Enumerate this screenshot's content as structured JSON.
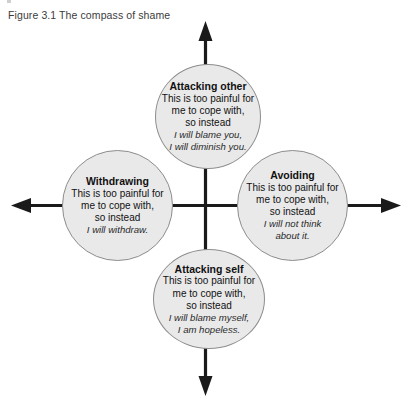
{
  "figure": {
    "caption": "Figure 3.1 The compass of shame",
    "background_color": "#ffffff",
    "circle_fill": "#e9e9e9",
    "circle_stroke": "#8d8d8d",
    "axis_color": "#1a1a1a"
  },
  "nodes": {
    "top": {
      "title": "Attacking other",
      "line1": "This is too painful for",
      "line2": "me to cope with,",
      "line3": "so instead",
      "italic1": "I will blame you,",
      "italic2": "I will diminish you."
    },
    "left": {
      "title": "Withdrawing",
      "line1": "This is too painful for",
      "line2": "me to cope with,",
      "line3": "so instead",
      "italic1": "I will withdraw.",
      "italic2": ""
    },
    "right": {
      "title": "Avoiding",
      "line1": "This is too painful for",
      "line2": "me to cope with,",
      "line3": "so instead",
      "italic1": "I will not think",
      "italic2": "about it."
    },
    "bottom": {
      "title": "Attacking self",
      "line1": "This is too painful for",
      "line2": "me to cope with,",
      "line3": "so instead",
      "italic1": "I will blame myself,",
      "italic2": "I am hopeless."
    }
  },
  "axes": {
    "up_arrow": "arrow-up",
    "down_arrow": "arrow-down",
    "left_arrow": "arrow-left",
    "right_arrow": "arrow-right"
  }
}
